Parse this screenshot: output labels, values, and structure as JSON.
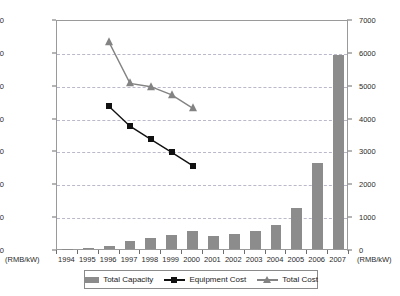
{
  "axes": {
    "left_unit": "(RMB/kW)",
    "right_unit": "(RMB/kW)",
    "left_ticks": [
      "0",
      "2000",
      "4000",
      "6000",
      "8000",
      "10000",
      "12000",
      "14000"
    ],
    "right_ticks": [
      "0",
      "1000",
      "2000",
      "3000",
      "4000",
      "5000",
      "6000",
      "7000"
    ]
  },
  "legend": {
    "items": [
      {
        "label": "Total Capacity",
        "marker": "bar-swatch",
        "color": "#8c8c8c"
      },
      {
        "label": "Equipment Cost",
        "marker": "square-line",
        "color": "#111111"
      },
      {
        "label": "Total Cost",
        "marker": "triangle-line",
        "color": "#838383"
      }
    ]
  },
  "chart_data": {
    "type": "bar",
    "title": "",
    "xlabel": "",
    "ylabel": "(RMB/kW)",
    "grid": true,
    "legend_position": "bottom",
    "categories": [
      "1994",
      "1995",
      "1996",
      "1997",
      "1998",
      "1999",
      "2000",
      "2001",
      "2002",
      "2003",
      "2004",
      "2005",
      "2006",
      "2007"
    ],
    "axis_left": {
      "label": "(RMB/kW)",
      "min": 0,
      "max": 14000,
      "tick_step": 2000
    },
    "axis_right": {
      "label": "(RMB/kW)",
      "min": 0,
      "max": 7000,
      "tick_step": 1000
    },
    "series": [
      {
        "name": "Total Capacity",
        "type": "bar",
        "axis": "right",
        "color": "#8c8c8c",
        "values": [
          10,
          30,
          90,
          230,
          330,
          420,
          560,
          400,
          460,
          540,
          720,
          1250,
          2620,
          5900
        ]
      },
      {
        "name": "Equipment Cost",
        "type": "line",
        "axis": "left",
        "color": "#111111",
        "marker": "square",
        "values": [
          null,
          null,
          8800,
          7600,
          6800,
          6000,
          5200,
          null,
          null,
          null,
          null,
          null,
          null,
          null
        ]
      },
      {
        "name": "Total Cost",
        "type": "line",
        "axis": "left",
        "color": "#838383",
        "marker": "triangle",
        "values": [
          null,
          null,
          12700,
          10200,
          10000,
          9500,
          8700,
          null,
          null,
          null,
          null,
          null,
          null,
          null
        ]
      }
    ]
  }
}
